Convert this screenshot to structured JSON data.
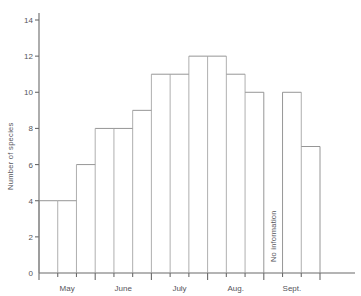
{
  "chart_data": {
    "type": "bar",
    "title": "",
    "subtitle": "",
    "xlabel": "",
    "ylabel": "Number of species",
    "ylim": [
      0,
      14
    ],
    "y_ticks": [
      0,
      2,
      4,
      6,
      8,
      10,
      12,
      14
    ],
    "y_tick_labels": [
      "0",
      "2",
      "4",
      "6",
      "8",
      "10",
      "12",
      "14"
    ],
    "grid": false,
    "legend": null,
    "x_group_labels": [
      "May",
      "June",
      "July",
      "Aug.",
      "Sept."
    ],
    "bar_style": "outline-only, contiguous columns (histogram)",
    "categories": [
      "May-1",
      "May-2",
      "May-3",
      "June-1",
      "June-2",
      "June-3",
      "July-1",
      "July-2",
      "July-3",
      "Aug-1",
      "Aug-2",
      "Aug-3",
      "Sept-1",
      "Sept-2",
      "Sept-3"
    ],
    "values": [
      4,
      4,
      6,
      8,
      8,
      9,
      11,
      11,
      12,
      12,
      11,
      10,
      null,
      10,
      7
    ],
    "annotations": [
      {
        "text": "No information",
        "category": "Sept-1",
        "orientation": "vertical",
        "meaning": "missing data for this interval"
      }
    ]
  },
  "axes": {
    "y_axis_title": "Number of species",
    "y_ticks": [
      "14",
      "12",
      "10",
      "8",
      "6",
      "4",
      "2",
      "0"
    ],
    "x_ticks": [
      "May",
      "June",
      "July",
      "Aug.",
      "Sept."
    ]
  },
  "colors": {
    "background": "#ffffff",
    "axis": "#6b6b6b",
    "bar_outline": "#8a8a8a",
    "text": "#55545a"
  }
}
